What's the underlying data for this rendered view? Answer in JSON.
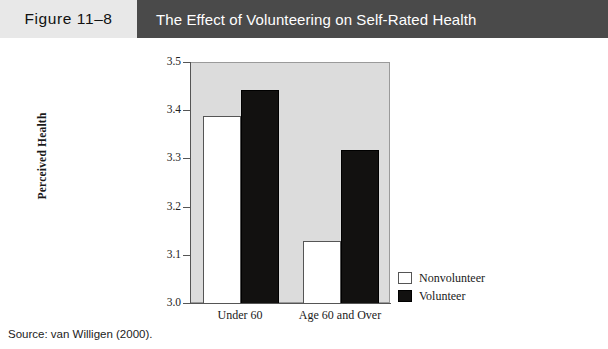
{
  "header": {
    "figure_label": "Figure 11–8",
    "title": "The Effect of Volunteering on Self-Rated Health",
    "label_background": "#e8e8e8",
    "title_background": "#4a4a4a",
    "title_color": "#ffffff"
  },
  "source": {
    "text": "Source: van Willigen (2000)."
  },
  "chart_data": {
    "type": "bar",
    "title": "The Effect of Volunteering on Self-Rated Health",
    "xlabel": "",
    "ylabel": "Perceived Health",
    "categories": [
      "Under 60",
      "Age 60 and Over"
    ],
    "series": [
      {
        "name": "Nonvolunteer",
        "color": "#ffffff",
        "values": [
          3.39,
          3.13
        ]
      },
      {
        "name": "Volunteer",
        "color": "#121110",
        "values": [
          3.445,
          3.32
        ]
      }
    ],
    "ylim": [
      3.0,
      3.5
    ],
    "yticks": [
      "3.0",
      "3.1",
      "3.2",
      "3.3",
      "3.4",
      "3.5"
    ],
    "grid": false,
    "legend_position": "right-bottom",
    "plot_background": "#dcdcdc"
  }
}
